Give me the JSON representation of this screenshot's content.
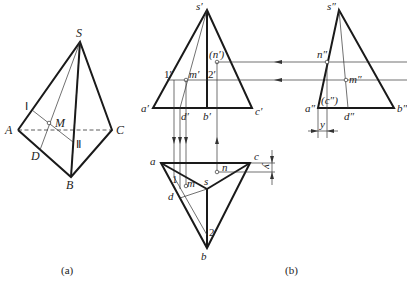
{
  "figure_a": {
    "caption": "(a)",
    "labels": {
      "S": "S",
      "A": "A",
      "B": "B",
      "C": "C",
      "D": "D",
      "M": "M",
      "I": "Ⅰ",
      "II": "Ⅱ"
    }
  },
  "figure_b": {
    "caption": "(b)",
    "front_view": {
      "s": "s′",
      "a": "a′",
      "b": "b′",
      "c": "c′",
      "d": "d′",
      "m": "m′",
      "n": "(n′)",
      "p1": "1′",
      "p2": "2′"
    },
    "side_view": {
      "s": "s″",
      "a": "a″",
      "b": "b″",
      "c": "(c″)",
      "d": "d″",
      "m": "m″",
      "n": "n″",
      "y": "y"
    },
    "top_view": {
      "a": "a",
      "b": "b",
      "c": "c",
      "s": "s",
      "d": "d",
      "m": "m",
      "n": "n",
      "p1": "1",
      "p2": "2",
      "y": "y"
    }
  },
  "colors": {
    "line": "#1a1a1a",
    "background": "#ffffff"
  }
}
